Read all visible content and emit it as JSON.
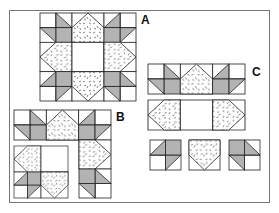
{
  "figure": {
    "labels": {
      "a": "A",
      "b": "B",
      "c": "C"
    },
    "colors": {
      "outline": "#222222",
      "shaded_triangle": "#b3b3b3",
      "background": "#ffffff",
      "speckle": "#333333",
      "frame": "#777777"
    },
    "panels": [
      {
        "id": "A",
        "caption": "Finished block: 3x3 arrangement of 4-patch corners, speckled point units on edges, plain center"
      },
      {
        "id": "B",
        "caption": "Block partially assembled: top row, right column and lower-left section"
      },
      {
        "id": "C",
        "caption": "Block rows: top row joined, middle row joined, bottom units separate"
      }
    ]
  }
}
